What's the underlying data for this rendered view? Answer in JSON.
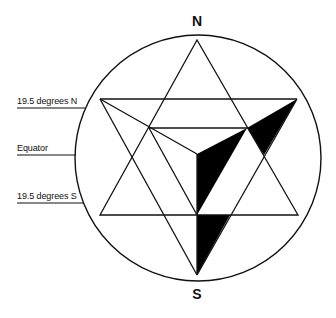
{
  "diagram": {
    "poles": {
      "north": "N",
      "south": "S"
    },
    "latitude_labels": [
      {
        "label": "19.5 degrees N",
        "y": 108
      },
      {
        "label": "Equator",
        "y": 155
      },
      {
        "label": "19.5 degrees S",
        "y": 203
      }
    ],
    "colors": {
      "stroke": "#111111",
      "fill_dark": "#000000",
      "background": "#ffffff"
    }
  }
}
